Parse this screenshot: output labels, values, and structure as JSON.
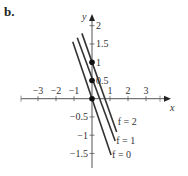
{
  "panel_label": "b.",
  "chart_data": {
    "type": "line",
    "title": "",
    "xlabel": "x",
    "ylabel": "y",
    "xlim": [
      -3.5,
      4
    ],
    "ylim": [
      -1.9,
      2.2
    ],
    "grid": false,
    "x_ticks": [
      -3,
      -2,
      -1,
      1,
      2,
      3
    ],
    "x_tick_labels": [
      "−3",
      "−2",
      "−1",
      "1",
      "2",
      "3"
    ],
    "y_ticks": [
      -1.5,
      -1,
      -0.5,
      0.5,
      1,
      1.5,
      2
    ],
    "y_tick_labels": [
      "−1.5",
      "−1",
      "−0.5",
      "0.5",
      "1",
      "1.5",
      "2"
    ],
    "series": [
      {
        "name": "f = 0",
        "label": "f = 0",
        "points": [
          [
            -1.07,
            1.56
          ],
          [
            1.06,
            -1.54
          ]
        ]
      },
      {
        "name": "f = 1",
        "label": "f = 1",
        "points": [
          [
            -0.82,
            1.67
          ],
          [
            1.29,
            -1.16
          ]
        ]
      },
      {
        "name": "f = 2",
        "label": "f = 2",
        "points": [
          [
            -0.56,
            1.79
          ],
          [
            1.37,
            -0.91
          ]
        ]
      }
    ],
    "points": [
      {
        "x": 0,
        "y": 0
      },
      {
        "x": 0,
        "y": 0.5
      },
      {
        "x": 0,
        "y": 1
      }
    ],
    "annotations": [
      "f = 2",
      "f = 1",
      "f = 0"
    ]
  }
}
